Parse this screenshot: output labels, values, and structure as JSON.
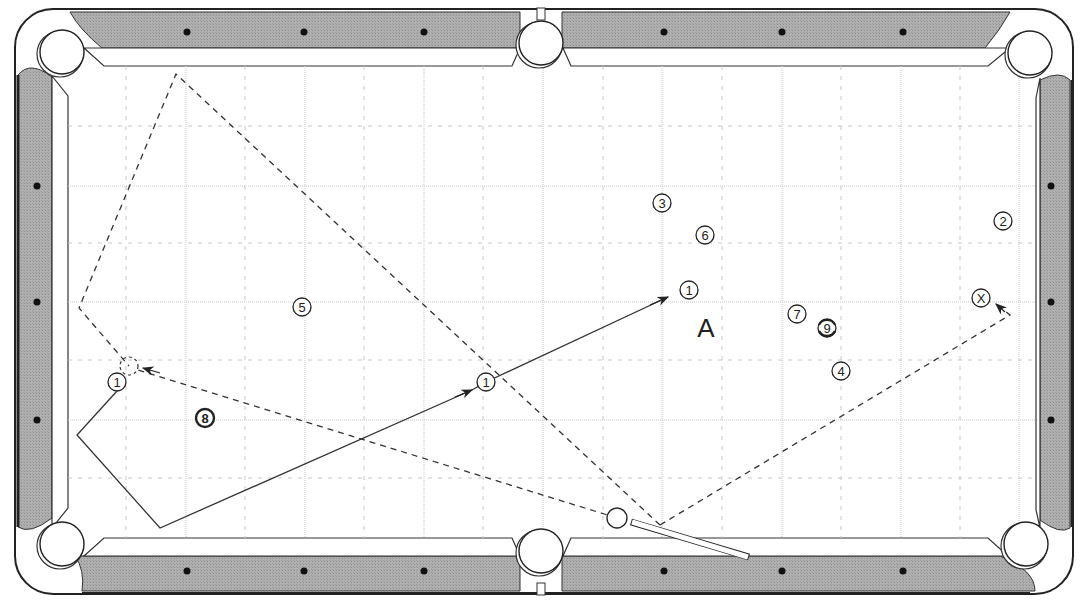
{
  "diagram": {
    "type": "pool-table-shot-diagram",
    "table": {
      "outer": {
        "x": 14,
        "y": 8,
        "w": 1060,
        "h": 587,
        "radius": 38
      },
      "rail_color": "#a8a8a8",
      "cushion_color": "#ffffff",
      "cloth_color": "#ffffff",
      "line_color": "#222222",
      "playfield": {
        "x": 68,
        "y": 66,
        "w": 968,
        "h": 472
      },
      "pockets": [
        {
          "name": "top-left",
          "x": 62,
          "y": 52
        },
        {
          "name": "top-middle",
          "x": 541,
          "y": 43
        },
        {
          "name": "top-right",
          "x": 1030,
          "y": 53
        },
        {
          "name": "bottom-left",
          "x": 62,
          "y": 544
        },
        {
          "name": "bottom-middle",
          "x": 541,
          "y": 551
        },
        {
          "name": "bottom-right",
          "x": 1026,
          "y": 544
        }
      ],
      "diamonds_top": [
        187,
        304,
        424,
        664,
        782,
        903
      ],
      "diamonds_bottom": [
        187,
        304,
        424,
        664,
        782,
        903
      ],
      "diamonds_left": [
        186,
        302,
        420
      ],
      "diamonds_right": [
        186,
        302,
        420
      ],
      "grid_x": [
        126,
        186,
        245,
        305,
        364,
        424,
        483,
        543,
        603,
        662,
        722,
        782,
        841,
        901,
        960,
        1019
      ],
      "grid_y": [
        126,
        186,
        243,
        302,
        360,
        420,
        478
      ]
    },
    "balls": [
      {
        "label": "3",
        "x": 662,
        "y": 203,
        "style": "outline"
      },
      {
        "label": "6",
        "x": 705,
        "y": 235,
        "style": "outline"
      },
      {
        "label": "2",
        "x": 1003,
        "y": 221,
        "style": "outline"
      },
      {
        "label": "1",
        "x": 689,
        "y": 290,
        "style": "outline",
        "note": "object ball final position"
      },
      {
        "label": "5",
        "x": 302,
        "y": 307,
        "style": "outline"
      },
      {
        "label": "7",
        "x": 797,
        "y": 314,
        "style": "outline"
      },
      {
        "label": "9",
        "x": 827,
        "y": 328,
        "style": "striped"
      },
      {
        "label": "4",
        "x": 841,
        "y": 371,
        "style": "outline"
      },
      {
        "label": "1",
        "x": 486,
        "y": 382,
        "style": "outline",
        "note": "object ball mid path"
      },
      {
        "label": "1",
        "x": 117,
        "y": 382,
        "style": "outline",
        "note": "object ball start"
      },
      {
        "label": "8",
        "x": 205,
        "y": 418,
        "style": "bold"
      },
      {
        "label": "X",
        "x": 981,
        "y": 298,
        "style": "outline",
        "note": "target position"
      }
    ],
    "cue_ball": {
      "x": 617,
      "y": 518
    },
    "ghost_ball": {
      "x": 129,
      "y": 366
    },
    "cue_stick": {
      "tip_x": 631,
      "tip_y": 522,
      "butt_x": 749,
      "butt_y": 557
    },
    "position_label": {
      "text": "A",
      "x": 706,
      "y": 328
    },
    "paths": {
      "object_ball_path": {
        "style": "solid",
        "points": [
          [
            117,
            391
          ],
          [
            77,
            435
          ],
          [
            160,
            528
          ],
          [
            472,
            390
          ],
          [
            486,
            382
          ],
          [
            668,
            297
          ]
        ]
      },
      "cue_ball_path_1": {
        "style": "dashed",
        "points": [
          [
            617,
            518
          ],
          [
            135,
            369
          ]
        ]
      },
      "cue_ball_path_2": {
        "style": "dashed",
        "points": [
          [
            660,
            525
          ],
          [
            1010,
            315
          ],
          [
            998,
            305
          ]
        ]
      },
      "cue_ball_alt_path": {
        "style": "dashed",
        "points": [
          [
            660,
            525
          ],
          [
            176,
            74
          ],
          [
            79,
            308
          ],
          [
            129,
            366
          ]
        ]
      }
    }
  }
}
